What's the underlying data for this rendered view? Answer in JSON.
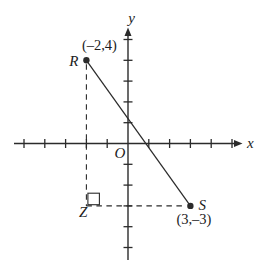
{
  "figure": {
    "background_color": "#ffffff",
    "line_color": "#2b2b2b",
    "text_color": "#1c1c1c",
    "x_axis_label": "x",
    "y_axis_label": "y",
    "origin_label": "O",
    "points": {
      "R": {
        "label": "R",
        "coord_label": "(–2,4)",
        "x": -2,
        "y": 4
      },
      "S": {
        "label": "S",
        "coord_label": "(3,–3)",
        "x": 3,
        "y": -3
      },
      "Z": {
        "label": "Z",
        "x": -2,
        "y": -3
      }
    },
    "solid_segment": {
      "from": "R",
      "to": "S"
    },
    "dashed_segments": [
      {
        "from": "R",
        "to": "Z"
      },
      {
        "from": "Z",
        "to": "S"
      }
    ],
    "right_angle_marker_at": "Z",
    "x_ticks": [
      -5,
      -4,
      -3,
      -2,
      -1,
      1,
      2,
      3,
      4,
      5
    ],
    "y_ticks": [
      -5,
      -4,
      -3,
      -2,
      -1,
      1,
      2,
      3,
      4,
      5
    ],
    "plot": {
      "origin_px": {
        "x": 128,
        "y": 143.5
      },
      "unit_px": 20.8,
      "x_axis_px": {
        "start": 14,
        "end": 242.5
      },
      "y_axis_px": {
        "start": 260,
        "end": 27.5
      }
    }
  }
}
